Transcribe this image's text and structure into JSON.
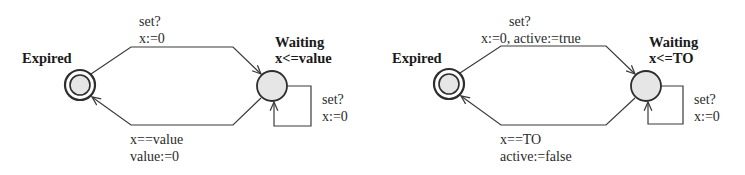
{
  "diagrams": [
    {
      "states": {
        "expired": {
          "name": "Expired",
          "initial": true
        },
        "waiting": {
          "name": "Waiting",
          "invariant": "x<=value"
        }
      },
      "transitions": {
        "expired_to_waiting": {
          "sync": "set?",
          "update": "x:=0"
        },
        "waiting_self": {
          "sync": "set?",
          "update": "x:=0"
        },
        "waiting_to_expired": {
          "guard": "x==value",
          "update": "value:=0"
        }
      }
    },
    {
      "states": {
        "expired": {
          "name": "Expired",
          "initial": true
        },
        "waiting": {
          "name": "Waiting",
          "invariant": "x<=TO"
        }
      },
      "transitions": {
        "expired_to_waiting": {
          "sync": "set?",
          "update": "x:=0, active:=true"
        },
        "waiting_self": {
          "sync": "set?",
          "update": "x:=0"
        },
        "waiting_to_expired": {
          "guard": "x==TO",
          "update": "active:=false"
        }
      }
    }
  ],
  "colors": {
    "stroke": "#3a3a3a",
    "state_fill": "#e6e6e6",
    "text": "#222222"
  }
}
